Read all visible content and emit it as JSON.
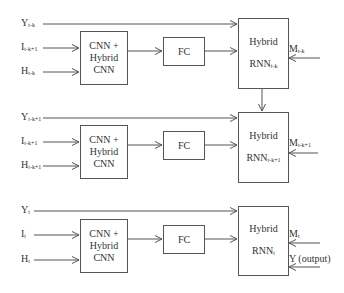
{
  "diagram": {
    "rows": [
      {
        "inputs": {
          "y": {
            "base": "Y",
            "sub": "t-k"
          },
          "i": {
            "base": "I",
            "sub": "t-k+1"
          },
          "h": {
            "base": "H",
            "sub": "t-k"
          }
        },
        "cnn": {
          "line1": "CNN +",
          "line2": "Hybrid",
          "line3": "CNN"
        },
        "fc": "FC",
        "rnn": {
          "line1": "Hybrid",
          "base": "RNN",
          "sub": "t-k"
        },
        "m": {
          "base": "M",
          "sub": "t-k"
        }
      },
      {
        "inputs": {
          "y": {
            "base": "Y",
            "sub": "t-k+1"
          },
          "i": {
            "base": "I",
            "sub": "t-k+1"
          },
          "h": {
            "base": "H",
            "sub": "t-k+1"
          }
        },
        "cnn": {
          "line1": "CNN +",
          "line2": "Hybrid",
          "line3": "CNN"
        },
        "fc": "FC",
        "rnn": {
          "line1": "Hybrid",
          "base": "RNN",
          "sub": "t-k+1"
        },
        "m": {
          "base": "M",
          "sub": "t-k+1"
        }
      },
      {
        "inputs": {
          "y": {
            "base": "Y",
            "sub": "t"
          },
          "i": {
            "base": "I",
            "sub": "t"
          },
          "h": {
            "base": "H",
            "sub": "t"
          }
        },
        "cnn": {
          "line1": "CNN +",
          "line2": "Hybrid",
          "line3": "CNN"
        },
        "fc": "FC",
        "rnn": {
          "line1": "Hybrid",
          "base": "RNN",
          "sub": "t"
        },
        "m": {
          "base": "M",
          "sub": "t"
        },
        "output": "Y (output)"
      }
    ]
  }
}
